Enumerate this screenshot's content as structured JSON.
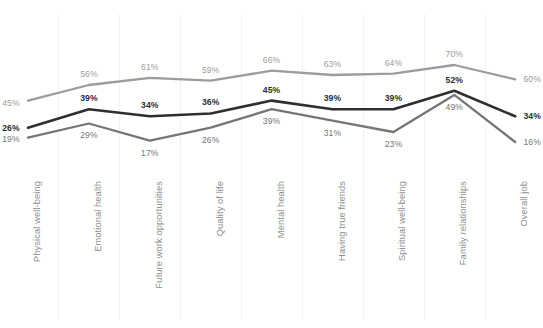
{
  "chart_data": {
    "type": "line",
    "title": "",
    "subtitle": "",
    "xlabel": "",
    "ylabel": "",
    "ylim": [
      0,
      75
    ],
    "grid": "vertical",
    "legend": "none",
    "value_suffix": "%",
    "categories": [
      "Physical well-being",
      "Emotional health",
      "Future work opportunities",
      "Quality of life",
      "Mental health",
      "Having true friends",
      "Spiritual well-being",
      "Family relationships",
      "Overall job"
    ],
    "series": [
      {
        "name": "series-top",
        "color": "#9c9c9c",
        "values": [
          45,
          56,
          61,
          59,
          66,
          63,
          64,
          70,
          60
        ],
        "labels": [
          "45%",
          "56%",
          "61%",
          "59%",
          "66%",
          "63%",
          "64%",
          "70%",
          "60%"
        ]
      },
      {
        "name": "series-middle",
        "color": "#2f2f2f",
        "values": [
          26,
          39,
          34,
          36,
          45,
          39,
          39,
          52,
          34
        ],
        "labels": [
          "26%",
          "39%",
          "34%",
          "36%",
          "45%",
          "39%",
          "39%",
          "52%",
          "34%"
        ]
      },
      {
        "name": "series-bottom",
        "color": "#767676",
        "values": [
          19,
          29,
          17,
          26,
          39,
          31,
          23,
          49,
          16
        ],
        "labels": [
          "19%",
          "29%",
          "17%",
          "26%",
          "39%",
          "31%",
          "23%",
          "49%",
          "16%"
        ]
      }
    ]
  }
}
